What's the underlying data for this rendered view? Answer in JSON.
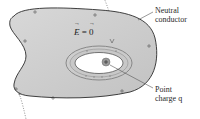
{
  "diagram": {
    "labels": {
      "conductor": [
        "Neutral",
        "conductor"
      ],
      "charge": [
        "Point",
        "charge q"
      ],
      "field": {
        "symbol": "E",
        "equals": "=",
        "value": "0"
      }
    },
    "signs": {
      "outer_surface": "+",
      "cavity_surface": "−",
      "point_charge": "+"
    },
    "colors": {
      "conductor_fill": "#cfcfcf",
      "conductor_stroke": "#2b2b2b",
      "cavity_fill": "#ffffff",
      "gaussian_ring": "#8a8a8a",
      "charge_fill": "#9a9a9a",
      "dotted_line": "#777777"
    }
  }
}
